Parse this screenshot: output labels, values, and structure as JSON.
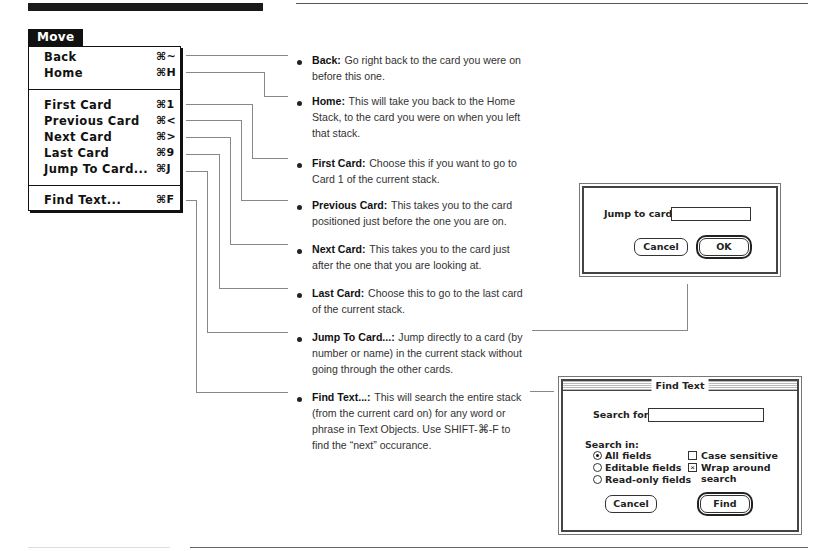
{
  "menu": {
    "title": "Move",
    "items": [
      {
        "label": "Back",
        "shortcut": "⌘~"
      },
      {
        "label": "Home",
        "shortcut": "⌘H"
      },
      {
        "label": "First Card",
        "shortcut": "⌘1"
      },
      {
        "label": "Previous Card",
        "shortcut": "⌘<"
      },
      {
        "label": "Next Card",
        "shortcut": "⌘>"
      },
      {
        "label": "Last Card",
        "shortcut": "⌘9"
      },
      {
        "label": "Jump To Card...",
        "shortcut": "⌘J"
      },
      {
        "label": "Find Text...",
        "shortcut": "⌘F"
      }
    ]
  },
  "descriptions": [
    {
      "term": "Back:",
      "text": "Go right back to the card you were on before this one."
    },
    {
      "term": "Home:",
      "text": "This will take you back to the Home Stack, to the card you were on when you left that stack."
    },
    {
      "term": "First Card:",
      "text": "Choose this if you want to go to Card 1 of the current stack."
    },
    {
      "term": "Previous Card:",
      "text": "This takes you to the card positioned just before the one you are on."
    },
    {
      "term": "Next Card:",
      "text": "This takes you to the card just after the one that you are looking at."
    },
    {
      "term": "Last Card:",
      "text": "Choose this to go to the last card of the current stack."
    },
    {
      "term": "Jump To Card...:",
      "text": "Jump directly to a card (by number or name) in the current stack without going through the other cards."
    },
    {
      "term": "Find Text...:",
      "text": "This will search the entire stack (from the current card on) for any word or phrase in Text Objects. Use SHIFT-⌘-F to find the “next” occurance."
    }
  ],
  "jump_dialog": {
    "label": "Jump to card:",
    "field_value": "",
    "cancel_label": "Cancel",
    "ok_label": "OK"
  },
  "find_dialog": {
    "title": "Find Text",
    "search_label": "Search for:",
    "search_value": "",
    "search_in_label": "Search in:",
    "radio_options": [
      {
        "label": "All fields",
        "selected": true
      },
      {
        "label": "Editable fields",
        "selected": false
      },
      {
        "label": "Read-only fields",
        "selected": false
      }
    ],
    "checkboxes": [
      {
        "label": "Case sensitive",
        "checked": false,
        "mark": ""
      },
      {
        "label": "Wrap around search",
        "checked": true,
        "mark": "×"
      }
    ],
    "cancel_label": "Cancel",
    "find_label": "Find"
  }
}
